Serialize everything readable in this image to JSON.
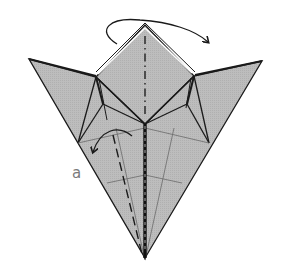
{
  "diagram": {
    "colors": {
      "paper_fill": "#b9b9b9",
      "paper_stroke": "#1a1a1a",
      "crease_thin": "#6a6a6a",
      "label": "#7a7a7a",
      "background": "#ffffff"
    },
    "labels": {
      "step_label": "a"
    },
    "annotations": [
      {
        "type": "arrow",
        "meaning": "turn top flap over to the right (curved arrow)"
      },
      {
        "type": "arrow",
        "meaning": "valley fold left edge toward center (curved arrow)"
      },
      {
        "type": "line",
        "meaning": "mountain fold line (dash-dot) down center of top square"
      },
      {
        "type": "line",
        "meaning": "valley fold line (dashed) on left lower panel"
      }
    ]
  }
}
